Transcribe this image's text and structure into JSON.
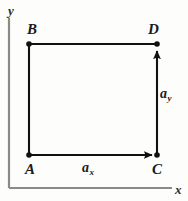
{
  "figure": {
    "kind": "vector-component-diagram",
    "background_color": "#fdfdfc",
    "ink_color": "#111111",
    "axis_color": "#8a8a86",
    "width": 188,
    "height": 201
  },
  "axes": {
    "x_label": "x",
    "y_label": "y",
    "origin": {
      "x": 9,
      "y": 188
    },
    "x_axis_end": {
      "x": 172,
      "y": 188
    },
    "y_axis_end": {
      "x": 9,
      "y": 18
    }
  },
  "points": [
    {
      "id": "A",
      "label": "A",
      "x": 29,
      "y": 155,
      "label_position": "below-left"
    },
    {
      "id": "B",
      "label": "B",
      "x": 29,
      "y": 44,
      "label_position": "above-left"
    },
    {
      "id": "C",
      "label": "C",
      "x": 157,
      "y": 155,
      "label_position": "below-right"
    },
    {
      "id": "D",
      "label": "D",
      "x": 157,
      "y": 44,
      "label_position": "above-right"
    }
  ],
  "edges": [
    {
      "id": "AB",
      "from": "A",
      "to": "B",
      "arrow": false
    },
    {
      "id": "BD",
      "from": "B",
      "to": "D",
      "arrow": false
    }
  ],
  "vectors": [
    {
      "id": "ax",
      "base_symbol": "a",
      "subscript": "x",
      "from": "A",
      "to": "C",
      "direction": "right",
      "arrow": true
    },
    {
      "id": "ay",
      "base_symbol": "a",
      "subscript": "y",
      "from": "C",
      "to": "D",
      "direction": "up",
      "arrow": true
    }
  ]
}
